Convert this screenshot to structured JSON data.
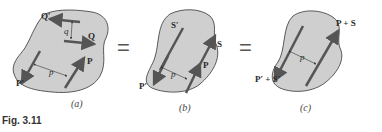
{
  "figure": {
    "caption": "Fig. 3.11",
    "equals_sign": "="
  },
  "panels": [
    {
      "id": "a",
      "caption": "(a)",
      "labels": {
        "Q_prime": "Q′",
        "Q": "Q",
        "q": "q",
        "P": "P",
        "P_prime": "P′",
        "p": "p"
      }
    },
    {
      "id": "b",
      "caption": "(b)",
      "labels": {
        "S_prime": "S′",
        "S": "S",
        "P": "P",
        "P_prime": "P′",
        "p": "p"
      }
    },
    {
      "id": "c",
      "caption": "(c)",
      "labels": {
        "sum": "P + S",
        "sum_prime": "P′ + S′",
        "p": "p"
      }
    }
  ],
  "colors": {
    "body_fill": "#cfcfcf",
    "body_stroke": "#333333",
    "vector": "#555555"
  }
}
